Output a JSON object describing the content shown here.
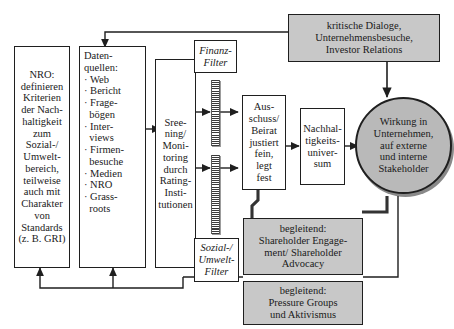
{
  "figure": {
    "title_ghost": "",
    "language": "de"
  },
  "nodes": {
    "nro": {
      "name": "NRO Kriterien",
      "lines": [
        "NRO:",
        "definieren",
        "Kriterien",
        "der Nach-",
        "haltigkeit",
        "zum",
        "Sozial-/",
        "Umwelt-",
        "bereich,",
        "teilweise",
        "auch mit",
        "Charakter",
        "von",
        "Standards",
        "(z. B. GRI)"
      ],
      "style": "plain"
    },
    "datenquellen": {
      "name": "Datenquellen",
      "lines": [
        "Daten-",
        "quellen:",
        "· Web",
        "· Bericht",
        "· Frage-",
        "  bögen",
        "· Inter-",
        "  views",
        "· Firmen-",
        "  besuche",
        "· Medien",
        "· NRO",
        "· Grass-",
        "  roots"
      ],
      "style": "plain"
    },
    "screening": {
      "name": "Screening Monitoring",
      "lines": [
        "Sree-",
        "ning/",
        "Moni-",
        "toring",
        "",
        "durch",
        "Rating-",
        "Insti-",
        "tutionen"
      ],
      "style": "plain"
    },
    "finanzfilter": {
      "name": "Finanz-Filter",
      "lines": [
        "Finanz-",
        "Filter"
      ],
      "style": "filter"
    },
    "sozialfilter": {
      "name": "Sozial-/Umwelt-Filter",
      "lines": [
        "Sozial-/",
        "Umwelt-",
        "Filter"
      ],
      "style": "filter"
    },
    "ausschuss": {
      "name": "Ausschuss Beirat",
      "lines": [
        "Aus-",
        "schuss/",
        "Beirat",
        "justiert",
        "fein,",
        "legt",
        "fest"
      ],
      "style": "plain"
    },
    "universum": {
      "name": "Nachhaltigkeitsuniversum",
      "lines": [
        "Nachhal-",
        "tigkeits-",
        "univer-",
        "sum"
      ],
      "style": "plain"
    },
    "wirkung": {
      "name": "Wirkung Stakeholder",
      "lines": [
        "Wirkung in",
        "Unternehmen,",
        "auf externe",
        "und interne",
        "Stakeholder"
      ],
      "style": "ellipse"
    },
    "dialoge": {
      "name": "kritische Dialoge",
      "lines": [
        "kritische Dialoge,",
        "Unternehmensbesuche,",
        "Investor Relations"
      ],
      "style": "shaded"
    },
    "shareholder": {
      "name": "Shareholder Engagement",
      "lines": [
        "begleitend:",
        "Shareholder Engage-",
        "ment/ Shareholder",
        "Advocacy"
      ],
      "style": "shaded"
    },
    "pressure": {
      "name": "Pressure Groups",
      "lines": [
        "begleitend:",
        "Pressure Groups",
        "und Aktivismus"
      ],
      "style": "shaded"
    }
  },
  "filters": {
    "finanz_bar_label": "finanz-filter-bar",
    "sozial_bar_label": "sozial-umwelt-filter-bar"
  },
  "colors": {
    "shaded_fill": "#c8c8c8",
    "ellipse_fill": "#b9b9b9",
    "stroke": "#1f1f1f",
    "page_background": "#ffffff"
  },
  "connectors": [
    {
      "id": "datenquellen-to-screening",
      "from": "datenquellen",
      "to": "screening",
      "kind": "arrow"
    },
    {
      "id": "screening-to-finanzfilter",
      "from": "screening",
      "to": "finanz-filter-bar",
      "kind": "arrow"
    },
    {
      "id": "finanzfilter-to-ausschuss",
      "from": "finanz-filter-bar",
      "to": "ausschuss",
      "kind": "arrow"
    },
    {
      "id": "screening-to-sozialfilter",
      "from": "screening",
      "to": "sozial-umwelt-filter-bar",
      "kind": "arrow"
    },
    {
      "id": "sozialfilter-to-ausschuss",
      "from": "sozial-umwelt-filter-bar",
      "to": "ausschuss",
      "kind": "arrow"
    },
    {
      "id": "ausschuss-to-universum",
      "from": "ausschuss",
      "to": "universum",
      "kind": "arrow"
    },
    {
      "id": "universum-to-wirkung",
      "from": "universum",
      "to": "wirkung",
      "kind": "arrow"
    },
    {
      "id": "dialoge-to-wirkung",
      "from": "dialoge",
      "to": "wirkung",
      "kind": "arrow"
    },
    {
      "id": "dialoge-to-datenquellen",
      "from": "dialoge",
      "to": "datenquellen",
      "kind": "feedback-arrow"
    },
    {
      "id": "ausschuss-to-shareholder",
      "from": "ausschuss",
      "to": "shareholder",
      "kind": "thick-line"
    },
    {
      "id": "wirkung-to-shareholder",
      "from": "wirkung",
      "to": "shareholder",
      "kind": "thick-line"
    },
    {
      "id": "wirkung-to-pressure",
      "from": "wirkung",
      "to": "pressure",
      "kind": "line"
    },
    {
      "id": "pressure-to-nro",
      "from": "pressure",
      "to": "nro",
      "kind": "feedback-arrow"
    },
    {
      "id": "pressure-to-datenquellen",
      "from": "pressure",
      "to": "datenquellen",
      "kind": "feedback-arrow"
    }
  ]
}
